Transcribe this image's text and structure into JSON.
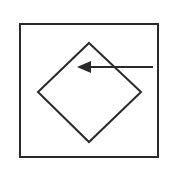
{
  "diagram": {
    "colors": {
      "background": "#ffffff",
      "stroke": "#2a2a2a"
    },
    "frame": {
      "x": 20,
      "y": 24,
      "width": 138,
      "height": 133,
      "stroke_width": 2
    },
    "diamond": {
      "top": [
        89,
        43
      ],
      "right": [
        141,
        92
      ],
      "bottom": [
        89,
        142
      ],
      "left": [
        38,
        92
      ],
      "stroke_width": 2
    },
    "arrow": {
      "from": [
        153,
        67
      ],
      "to": [
        77,
        67
      ],
      "direction": "left",
      "stroke_width": 2
    }
  }
}
